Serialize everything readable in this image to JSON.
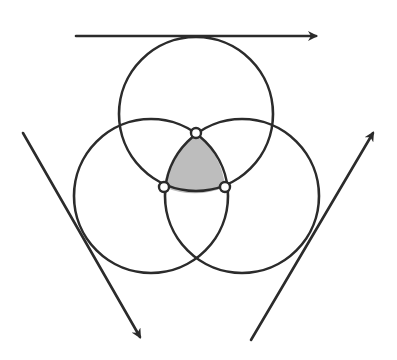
{
  "diagram": {
    "width": 397,
    "height": 360,
    "colors": {
      "stroke": "#2b2b2b",
      "shade": "#bdbdbd",
      "background": "#ffffff",
      "point_fill": "#ffffff"
    },
    "stroke_width": 2.6,
    "circles": [
      {
        "id": "top",
        "cx": 196,
        "cy": 114,
        "r": 77
      },
      {
        "id": "left",
        "cx": 151,
        "cy": 196,
        "r": 77
      },
      {
        "id": "right",
        "cx": 242,
        "cy": 196,
        "r": 77
      }
    ],
    "intersection_points": [
      {
        "id": "p-top",
        "x": 196,
        "y": 133
      },
      {
        "id": "p-left",
        "x": 164,
        "y": 187
      },
      {
        "id": "p-right",
        "x": 225,
        "y": 187
      }
    ],
    "point_radius": 5,
    "arrows": [
      {
        "id": "top-arrow",
        "x1": 76,
        "y1": 36,
        "x2": 316,
        "y2": 36,
        "direction": "right"
      },
      {
        "id": "left-arrow",
        "x1": 23,
        "y1": 133,
        "x2": 140,
        "y2": 337,
        "direction": "down-right"
      },
      {
        "id": "right-arrow",
        "x1": 251,
        "y1": 340,
        "x2": 373,
        "y2": 133,
        "direction": "up-right"
      }
    ]
  }
}
